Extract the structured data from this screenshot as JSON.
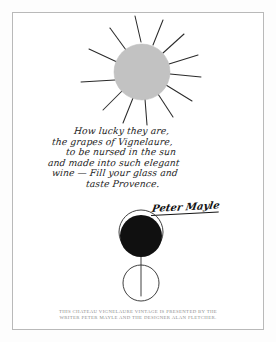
{
  "poster": {
    "title": "Chateau Vignelaure Vintage Poster",
    "background_color": "#ffffff",
    "frame_color": "#b9b9b9",
    "ink_color": "#1b1b1b",
    "sun_fill_color": "#c2c2c2",
    "grape_fill_color": "#101010",
    "caption_color": "#8d8d8d"
  },
  "sun": {
    "name": "sun-drawing",
    "ray_count": 12,
    "disc_label": "sun disc"
  },
  "handwriting": {
    "lines": [
      "How lucky they are,",
      "the grapes of Vignelaure,",
      "to be nursed in the sun",
      "and made into such elegant",
      "wine — Fill your glass and",
      "taste Provence."
    ],
    "signature": "Peter Mayle"
  },
  "glass": {
    "name": "wine-glass-drawing",
    "bowl_label": "filled grape bowl",
    "stem_label": "glass stem",
    "base_label": "glass base"
  },
  "caption": {
    "lines": [
      "THIS CHATEAU VIGNELAURE VINTAGE IS PRESENTED BY THE",
      "WRITER PETER MAYLE AND THE DESIGNER ALAN FLETCHER."
    ]
  }
}
